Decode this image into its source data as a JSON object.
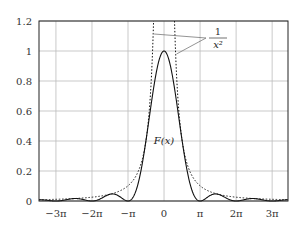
{
  "chart_data": {
    "type": "line",
    "title": "",
    "xlabel": "",
    "ylabel": "",
    "xlim_pi": [
      -3.47,
      3.44
    ],
    "ylim": [
      0,
      1.2
    ],
    "grid": true,
    "xticks": [
      {
        "value_pi": -3,
        "label": "−3π"
      },
      {
        "value_pi": -2,
        "label": "−2π"
      },
      {
        "value_pi": -1,
        "label": "−π"
      },
      {
        "value_pi": 0,
        "label": "0"
      },
      {
        "value_pi": 1,
        "label": "π"
      },
      {
        "value_pi": 2,
        "label": "2π"
      },
      {
        "value_pi": 3,
        "label": "3π"
      }
    ],
    "yticks": [
      {
        "value": 0,
        "label": "0"
      },
      {
        "value": 0.2,
        "label": "0.2"
      },
      {
        "value": 0.4,
        "label": "0.4"
      },
      {
        "value": 0.6,
        "label": "0.6"
      },
      {
        "value": 0.8,
        "label": "0.8"
      },
      {
        "value": 1.0,
        "label": "1"
      },
      {
        "value": 1.2,
        "label": "1.2"
      }
    ],
    "series": [
      {
        "name": "F(x)",
        "function": "sin(x)^2 / x^2",
        "style": "solid",
        "label": "F(x)",
        "key_points": [
          {
            "x_pi": 0,
            "y": 1.0
          },
          {
            "x_pi": 1,
            "y": 0
          },
          {
            "x_pi": 1.43,
            "y": 0.047
          },
          {
            "x_pi": 2,
            "y": 0
          },
          {
            "x_pi": 2.46,
            "y": 0.016
          },
          {
            "x_pi": 3,
            "y": 0
          }
        ]
      },
      {
        "name": "1/x^2",
        "function": "1 / x^2",
        "style": "dotted",
        "label_num": "1",
        "label_den": "x²",
        "key_points": [
          {
            "x_pi": 1,
            "y": 0.101
          },
          {
            "x_pi": 2,
            "y": 0.025
          },
          {
            "x_pi": 3,
            "y": 0.011
          }
        ]
      }
    ],
    "annotations": [
      {
        "text": "F(x)",
        "near_series": "F(x)"
      },
      {
        "text": "1/x²",
        "near_series": "1/x^2",
        "arrows": 2
      }
    ]
  }
}
